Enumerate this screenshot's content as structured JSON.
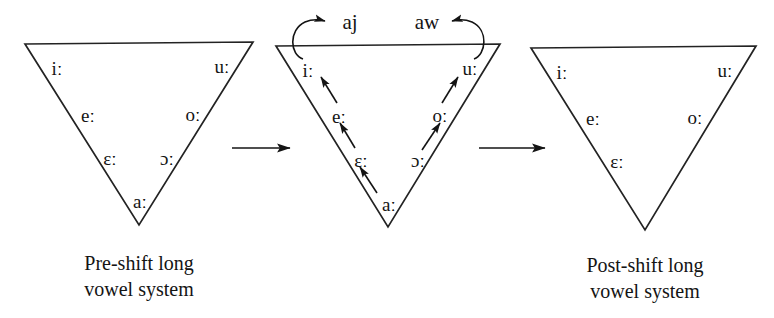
{
  "figure": {
    "background_color": "#ffffff",
    "ink_color": "#141414"
  },
  "panels": [
    {
      "id": "pre-shift",
      "caption_line1": "Pre-shift long",
      "caption_line2": "vowel system",
      "vowels": [
        {
          "symbol": "iː",
          "name": "close-front-long"
        },
        {
          "symbol": "uː",
          "name": "close-back-long"
        },
        {
          "symbol": "eː",
          "name": "close-mid-front-long"
        },
        {
          "symbol": "oː",
          "name": "close-mid-back-long"
        },
        {
          "symbol": "ɛː",
          "name": "open-mid-front-long"
        },
        {
          "symbol": "ɔː",
          "name": "open-mid-back-long"
        },
        {
          "symbol": "aː",
          "name": "open-long"
        }
      ]
    },
    {
      "id": "shift-in-progress",
      "caption_line1": "",
      "caption_line2": "",
      "vowels": [
        {
          "symbol": "iː",
          "name": "close-front-long"
        },
        {
          "symbol": "uː",
          "name": "close-back-long"
        },
        {
          "symbol": "eː",
          "name": "close-mid-front-long"
        },
        {
          "symbol": "oː",
          "name": "close-mid-back-long"
        },
        {
          "symbol": "ɛː",
          "name": "open-mid-front-long"
        },
        {
          "symbol": "ɔː",
          "name": "open-mid-back-long"
        },
        {
          "symbol": "aː",
          "name": "open-long"
        }
      ],
      "diphthongs": [
        {
          "symbol": "aj",
          "name": "diphthong-aj",
          "source": "iː"
        },
        {
          "symbol": "aw",
          "name": "diphthong-aw",
          "source": "uː"
        }
      ],
      "raising_arrows": [
        {
          "from": "eː",
          "to": "iː"
        },
        {
          "from": "ɛː",
          "to": "eː"
        },
        {
          "from": "aː",
          "to": "ɛː"
        },
        {
          "from": "oː",
          "to": "uː"
        },
        {
          "from": "ɔː",
          "to": "oː"
        }
      ]
    },
    {
      "id": "post-shift",
      "caption_line1": "Post-shift long",
      "caption_line2": "vowel system",
      "vowels": [
        {
          "symbol": "iː",
          "name": "close-front-long"
        },
        {
          "symbol": "uː",
          "name": "close-back-long"
        },
        {
          "symbol": "eː",
          "name": "close-mid-front-long"
        },
        {
          "symbol": "oː",
          "name": "close-mid-back-long"
        },
        {
          "symbol": "ɛː",
          "name": "open-mid-front-long"
        }
      ]
    }
  ],
  "connectors": [
    {
      "name": "stage-arrow-1",
      "direction": "right"
    },
    {
      "name": "stage-arrow-2",
      "direction": "right"
    }
  ]
}
